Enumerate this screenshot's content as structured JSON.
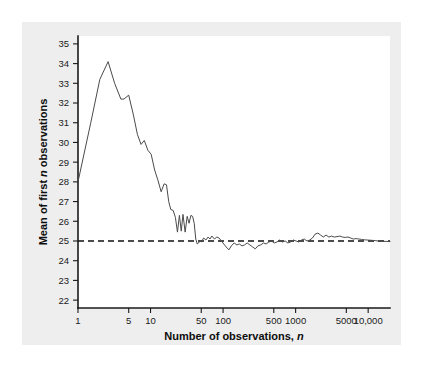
{
  "figure": {
    "background_color": "#ffffff",
    "panel_color": "#eeeeee",
    "plot_background": "#ffffff"
  },
  "chart_data": {
    "type": "line",
    "title": "",
    "subtitle": "",
    "xlabel": "Number of observations, n",
    "xlabel_plain": "Number of observations,",
    "xlabel_italic": "n",
    "ylabel": "Mean of first n observations",
    "ylabel_plain_before": "Mean of first",
    "ylabel_italic": "n",
    "ylabel_plain_after": "observations",
    "xscale": "log",
    "yscale": "linear",
    "xlim": [
      1,
      20000
    ],
    "ylim": [
      21.6,
      35.4
    ],
    "grid": false,
    "legend": null,
    "xticks": [
      1,
      5,
      10,
      50,
      100,
      500,
      1000,
      5000,
      10000
    ],
    "xticklabels": [
      "1",
      "5",
      "10",
      "50",
      "100",
      "500",
      "1000",
      "5000",
      "10,000"
    ],
    "yticks": [
      22,
      23,
      24,
      25,
      26,
      27,
      28,
      29,
      30,
      31,
      32,
      33,
      34,
      35
    ],
    "yticklabels": [
      "22",
      "23",
      "24",
      "25",
      "26",
      "27",
      "28",
      "29",
      "30",
      "31",
      "32",
      "33",
      "34",
      "35"
    ],
    "series": [
      {
        "name": "Running mean of first n observations",
        "color": "#4a4a4a",
        "style": "solid",
        "x": [
          1,
          1.5,
          2,
          2.6,
          3.2,
          3.9,
          4.3,
          5,
          5.8,
          6.6,
          7.4,
          8.2,
          9.2,
          10.2,
          11.4,
          12.6,
          14,
          15.4,
          16.6,
          17.8,
          19,
          20.5,
          22,
          23.5,
          25,
          26.5,
          28,
          30,
          32,
          34,
          36,
          38,
          40,
          42,
          44,
          46,
          48,
          50,
          54,
          58,
          62,
          66,
          70,
          76,
          82,
          88,
          95,
          102,
          110,
          120,
          130,
          142,
          155,
          168,
          182,
          198,
          215,
          234,
          255,
          278,
          302,
          330,
          360,
          392,
          428,
          466,
          508,
          554,
          604,
          658,
          718,
          782,
          852,
          930,
          1014,
          1106,
          1206,
          1315,
          1434,
          1564,
          1705,
          1860,
          2028,
          2212,
          2412,
          2630,
          2868,
          3128,
          3412,
          3720,
          4058,
          4426,
          4826,
          5264,
          5740,
          6260,
          6826,
          7444,
          8118,
          8852,
          9654,
          10528,
          11480,
          12520,
          13650,
          14880,
          16220,
          17690,
          19290,
          20000
        ],
        "y": [
          28.0,
          31.0,
          33.2,
          34.1,
          33.0,
          32.2,
          32.2,
          32.4,
          31.4,
          30.4,
          29.9,
          30.1,
          29.6,
          29.4,
          28.6,
          28.1,
          27.5,
          27.9,
          27.85,
          27.0,
          26.6,
          26.55,
          26.2,
          25.45,
          26.3,
          25.5,
          26.35,
          25.45,
          26.25,
          25.9,
          26.3,
          26.25,
          25.9,
          25.1,
          24.85,
          24.9,
          25.0,
          24.95,
          25.15,
          25.05,
          25.2,
          25.1,
          25.25,
          25.1,
          25.2,
          25.15,
          25.0,
          24.85,
          24.7,
          24.55,
          24.75,
          24.9,
          24.8,
          24.85,
          24.75,
          24.8,
          24.9,
          24.8,
          24.7,
          24.6,
          24.75,
          24.8,
          24.9,
          24.85,
          24.95,
          25.0,
          24.9,
          24.95,
          25.05,
          24.95,
          25.0,
          24.9,
          24.95,
          25.05,
          25.0,
          24.95,
          25.05,
          25.1,
          25.0,
          25.05,
          25.15,
          25.35,
          25.4,
          25.3,
          25.2,
          25.3,
          25.2,
          25.25,
          25.2,
          25.22,
          25.25,
          25.2,
          25.18,
          25.2,
          25.15,
          25.1,
          25.12,
          25.1,
          25.08,
          25.06,
          25.05,
          25.04,
          25.03,
          25.02,
          25.0,
          25.0,
          24.98,
          24.98,
          24.97,
          24.97
        ]
      }
    ],
    "reference_lines": [
      {
        "name": "population-mean",
        "orientation": "horizontal",
        "value": 25,
        "style": "dashed",
        "color": "#111111"
      }
    ],
    "annotations": [
      {
        "name": "peak-value",
        "x": 2.6,
        "y": 34.1
      },
      {
        "name": "start-value",
        "x": 1,
        "y": 28.0
      },
      {
        "name": "converged-value",
        "x": 20000,
        "y": 24.97
      }
    ]
  }
}
